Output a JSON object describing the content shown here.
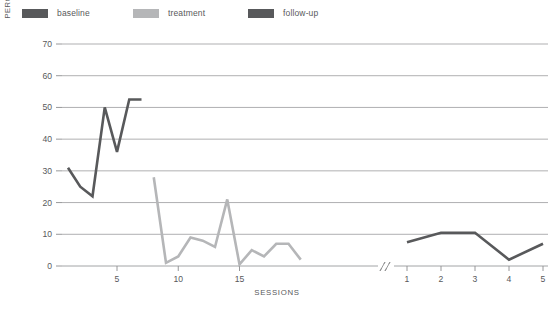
{
  "legend": {
    "items": [
      {
        "label": "baseline",
        "color": "#58595b",
        "name": "legend-item-baseline"
      },
      {
        "label": "treatment",
        "color": "#b5b6b8",
        "name": "legend-item-treatment"
      },
      {
        "label": "follow-up",
        "color": "#58595b",
        "name": "legend-item-followup"
      }
    ]
  },
  "axis_title_line1": "PERCENTAGE OF INAPPROPRIATE",
  "axis_title_line2": "MEALTIME BEHAVIOR",
  "chart_data": {
    "type": "line",
    "title": "",
    "xlabel": "SESSIONS",
    "ylabel": "PERCENTAGE OF INAPPROPRIATE MEALTIME BEHAVIOR",
    "ylim": [
      0,
      70
    ],
    "yticks": [
      0,
      10,
      20,
      30,
      40,
      50,
      60,
      70
    ],
    "ytick_labels": [
      "0",
      "10",
      "20",
      "30",
      "40",
      "50",
      "60",
      "70"
    ],
    "grid": true,
    "grid_axis": "y",
    "legend_position": "top-left",
    "axis_break": true,
    "axis_break_label": "//",
    "panels": [
      {
        "name": "sessions-main",
        "xticks": [
          5,
          10,
          15
        ],
        "xtick_labels": [
          "5",
          "10",
          "15"
        ],
        "xlim": [
          1,
          21
        ]
      },
      {
        "name": "sessions-followup",
        "xticks": [
          1,
          2,
          3,
          4,
          5
        ],
        "xtick_labels": [
          "1",
          "2",
          "3",
          "4",
          "5"
        ],
        "xlim": [
          1,
          5
        ]
      }
    ],
    "series": [
      {
        "name": "baseline",
        "color": "#58595b",
        "panel": "sessions-main",
        "x": [
          1,
          2,
          3,
          4,
          5,
          6,
          7
        ],
        "values": [
          31,
          25,
          22,
          50,
          36,
          52.5,
          52.5
        ]
      },
      {
        "name": "treatment",
        "color": "#b5b6b8",
        "panel": "sessions-main",
        "x": [
          8,
          9,
          10,
          11,
          12,
          13,
          14,
          15,
          16,
          17,
          18,
          19,
          20
        ],
        "values": [
          28,
          1,
          3,
          9,
          8,
          6,
          21,
          0.5,
          5,
          3,
          7,
          7,
          2
        ]
      },
      {
        "name": "follow-up",
        "color": "#58595b",
        "panel": "sessions-followup",
        "x": [
          1,
          2,
          3,
          4,
          5
        ],
        "values": [
          7.5,
          10.5,
          10.5,
          2,
          7
        ]
      }
    ]
  }
}
